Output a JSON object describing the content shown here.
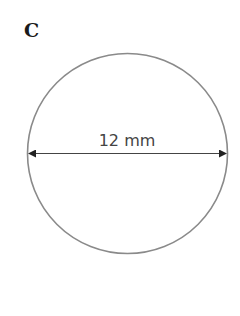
{
  "figure": {
    "label": "C",
    "shape": "circle",
    "dimension": {
      "type": "diameter",
      "text": "12 mm",
      "value": 12,
      "unit": "mm"
    },
    "colors": {
      "outline": "#8a8a8a",
      "arrow": "#333333",
      "text": "#444444"
    }
  }
}
